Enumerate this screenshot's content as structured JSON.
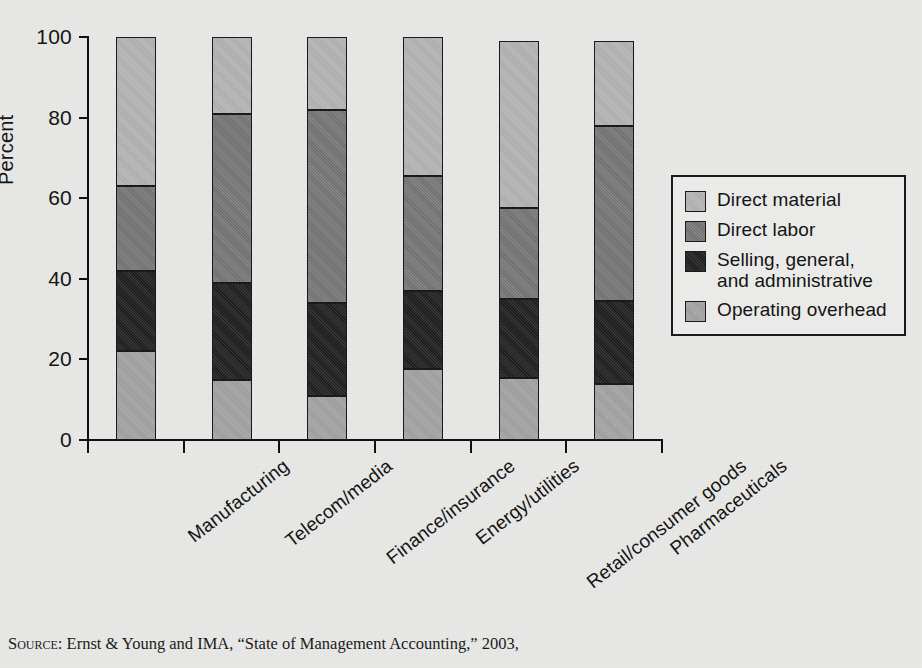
{
  "chart_data": {
    "type": "bar",
    "subtype": "stacked-bar-100-percent",
    "title": "",
    "xlabel": "",
    "ylabel": "Percent",
    "ylim": [
      0,
      100
    ],
    "yticks": [
      0,
      20,
      40,
      60,
      80,
      100
    ],
    "grid": false,
    "legend_position": "right",
    "stack_order_bottom_to_top": [
      "Operating overhead",
      "Selling, general, and administrative",
      "Direct labor",
      "Direct material"
    ],
    "categories": [
      "Manufacturing",
      "Telecom/media",
      "Finance/insurance",
      "Energy/utilities",
      "Retail/consumer goods",
      "Pharmaceuticals"
    ],
    "series": [
      {
        "name": "Operating overhead",
        "color": "#a3a3a3",
        "values": [
          22,
          15,
          11,
          17.5,
          15.5,
          14
        ]
      },
      {
        "name": "Selling, general, and administrative",
        "color": "#1f1f1f",
        "values": [
          20,
          24,
          23,
          19.5,
          19.5,
          20.5
        ]
      },
      {
        "name": "Direct labor",
        "color": "#767676",
        "values": [
          21,
          42,
          48,
          28.5,
          22.5,
          43.5
        ]
      },
      {
        "name": "Direct material",
        "color": "#b4b4b4",
        "values": [
          37,
          19,
          18,
          34.5,
          41.5,
          21
        ]
      }
    ],
    "cumulative_tops": [
      [
        22,
        42,
        63,
        100
      ],
      [
        15,
        39,
        81,
        100
      ],
      [
        11,
        34,
        82,
        99.5
      ],
      [
        17.5,
        37,
        65.5,
        99.5
      ],
      [
        15.5,
        35,
        57.5,
        99
      ],
      [
        14,
        34.5,
        78,
        99
      ]
    ]
  },
  "axis": {
    "y_label": "Percent",
    "y_tick_labels": [
      "100",
      "80",
      "60",
      "40",
      "20",
      "0"
    ]
  },
  "legend": {
    "items": [
      {
        "label": "Direct material",
        "color": "#b4b4b4"
      },
      {
        "label": "Direct labor",
        "color": "#767676"
      },
      {
        "label": "Selling, general,",
        "label2": "and administrative",
        "color": "#1f1f1f"
      },
      {
        "label": "Operating overhead",
        "color": "#a3a3a3"
      }
    ]
  },
  "source": {
    "prefix": "Source",
    "text": ": Ernst & Young and IMA, “State of Management Accounting,” 2003,"
  }
}
